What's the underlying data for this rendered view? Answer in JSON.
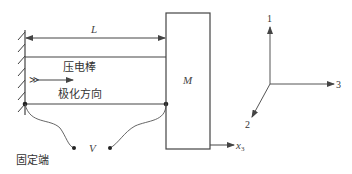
{
  "diagram": {
    "title": "",
    "labels": {
      "length": "L",
      "rod": "压电棒",
      "polarization": "极化方向",
      "polarization_symbol": "≫",
      "mass": "M",
      "voltage": "V",
      "fixed_end": "固定端",
      "displacement_axis": "x",
      "displacement_axis_sub": "3"
    },
    "coordinate_axes": {
      "axis_1": "1",
      "axis_2": "2",
      "axis_3": "3"
    },
    "colors": {
      "stroke": "#444444",
      "text": "#333333",
      "background": "#ffffff"
    }
  }
}
